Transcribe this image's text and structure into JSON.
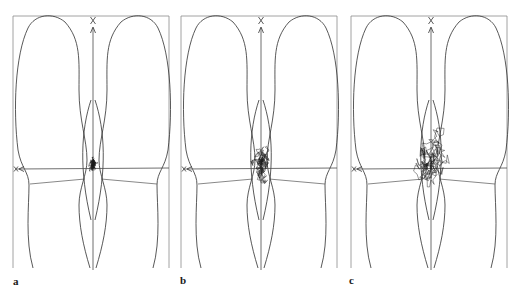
{
  "figure": {
    "panels": [
      {
        "id": "a",
        "label": "a",
        "x": 13,
        "spread": 7,
        "steps": 260,
        "seed": 11,
        "bias_up": 2
      },
      {
        "id": "b",
        "label": "b",
        "x": 181,
        "spread": 17,
        "steps": 240,
        "seed": 37,
        "bias_up": 4
      },
      {
        "id": "c",
        "label": "c",
        "x": 351,
        "spread": 26,
        "steps": 230,
        "seed": 73,
        "bias_up": 14
      }
    ],
    "axis_markers": {
      "vertical_top": "X",
      "horizontal_left": "X"
    },
    "colors": {
      "outline": "#2e2e2e",
      "frame": "#8a8a8a",
      "trace": "#1a1a1a",
      "background": "#ffffff"
    }
  }
}
